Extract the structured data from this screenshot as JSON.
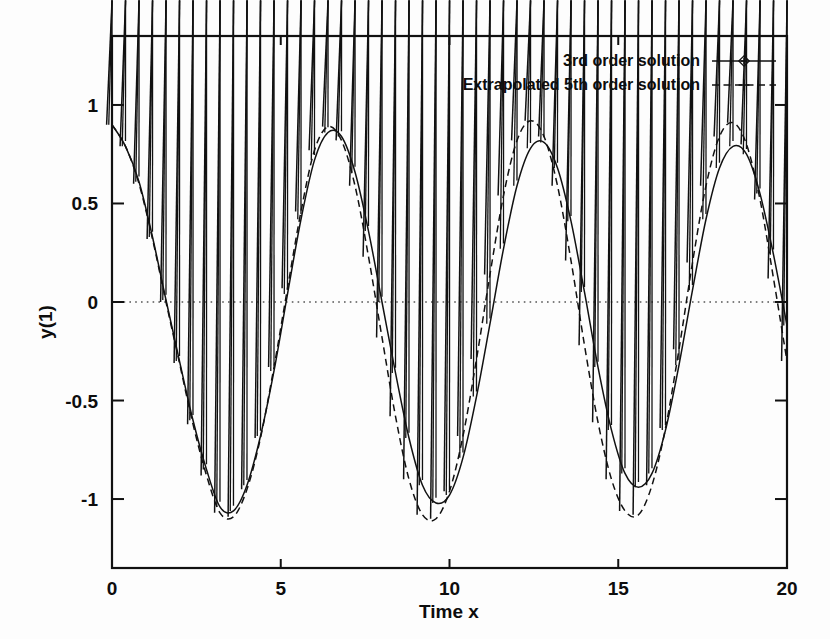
{
  "chart_data": {
    "type": "line",
    "title": "",
    "xlabel": "Time  x",
    "ylabel": "y(1)",
    "xlim": [
      0,
      20
    ],
    "ylim": [
      -1.35,
      1.35
    ],
    "xticks": [
      0,
      5,
      10,
      15,
      20
    ],
    "xtick_labels": [
      "0",
      "5",
      "10",
      "15",
      "20"
    ],
    "yticks": [
      -1,
      -0.5,
      0,
      0.5,
      1
    ],
    "ytick_labels": [
      "-1",
      "-0.5",
      "0",
      "0.5",
      "1"
    ],
    "grid": false,
    "zero_line": true,
    "legend_position": "top-right",
    "series": [
      {
        "name": "3rd order solution",
        "line_style": "solid",
        "marker": "diamond",
        "color": "#111111",
        "x": [
          0.0,
          0.4,
          0.8,
          1.2,
          1.6,
          2.0,
          2.4,
          2.8,
          3.2,
          3.6,
          4.0,
          4.4,
          4.8,
          5.2,
          5.6,
          6.0,
          6.4,
          6.8,
          7.2,
          7.6,
          8.0,
          8.4,
          8.8,
          9.2,
          9.6,
          10.0,
          10.4,
          10.8,
          11.2,
          11.6,
          12.0,
          12.4,
          12.8,
          13.2,
          13.6,
          14.0,
          14.4,
          14.8,
          15.2,
          15.6,
          16.0,
          16.4,
          16.8,
          17.2,
          17.6,
          18.0,
          18.4,
          18.8,
          19.2,
          19.6,
          20.0
        ],
        "y": [
          0.9,
          0.79,
          0.61,
          0.33,
          0.01,
          -0.3,
          -0.6,
          -0.85,
          -1.04,
          -1.06,
          -0.93,
          -0.68,
          -0.35,
          0.04,
          0.42,
          0.72,
          0.86,
          0.84,
          0.66,
          0.36,
          0.0,
          -0.36,
          -0.69,
          -0.93,
          -1.02,
          -0.98,
          -0.79,
          -0.48,
          -0.11,
          0.27,
          0.59,
          0.78,
          0.81,
          0.68,
          0.41,
          0.05,
          -0.33,
          -0.65,
          -0.87,
          -0.94,
          -0.87,
          -0.65,
          -0.32,
          0.06,
          0.42,
          0.68,
          0.79,
          0.75,
          0.55,
          0.24,
          -0.12
        ]
      },
      {
        "name": "Extrapolated 5th order solution",
        "line_style": "dashed",
        "marker": "plus",
        "color": "#111111",
        "x": [
          0.0,
          0.4,
          0.8,
          1.2,
          1.6,
          2.0,
          2.4,
          2.8,
          3.2,
          3.6,
          4.0,
          4.4,
          4.8,
          5.2,
          5.6,
          6.0,
          6.4,
          6.8,
          7.2,
          7.6,
          8.0,
          8.4,
          8.8,
          9.2,
          9.6,
          10.0,
          10.4,
          10.8,
          11.2,
          11.6,
          12.0,
          12.4,
          12.8,
          13.2,
          13.6,
          14.0,
          14.4,
          14.8,
          15.2,
          15.6,
          16.0,
          16.4,
          16.8,
          17.2,
          17.6,
          18.0,
          18.4,
          18.8,
          19.2,
          19.6,
          20.0
        ],
        "y": [
          0.9,
          0.79,
          0.6,
          0.32,
          0.0,
          -0.31,
          -0.62,
          -0.88,
          -1.07,
          -1.09,
          -0.95,
          -0.69,
          -0.33,
          0.07,
          0.46,
          0.77,
          0.89,
          0.82,
          0.59,
          0.23,
          -0.18,
          -0.58,
          -0.9,
          -1.08,
          -1.1,
          -0.96,
          -0.68,
          -0.29,
          0.14,
          0.54,
          0.82,
          0.92,
          0.84,
          0.59,
          0.21,
          -0.22,
          -0.61,
          -0.9,
          -1.06,
          -1.08,
          -0.93,
          -0.64,
          -0.24,
          0.2,
          0.59,
          0.84,
          0.91,
          0.8,
          0.52,
          0.12,
          -0.3
        ]
      }
    ]
  },
  "legend": {
    "entries": [
      {
        "label": "3rd order solution",
        "style": "solid-diamond"
      },
      {
        "label": "Extrapolated 5th order solution",
        "style": "dashed-plus"
      }
    ]
  },
  "axes": {
    "x_label": "Time  x",
    "y_label": "y(1)"
  },
  "colors": {
    "ink": "#111111",
    "background": "#fdfdfd",
    "zero_line": "#555555"
  }
}
